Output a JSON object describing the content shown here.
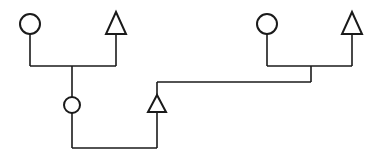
{
  "diagram": {
    "type": "pedigree",
    "stroke_color": "#1a1a1a",
    "background": "#ffffff",
    "nodes": [
      {
        "id": "gen1-left-female",
        "shape": "circle",
        "sex": "female",
        "cx": 30,
        "cy": 24,
        "r": 10
      },
      {
        "id": "gen1-left-male",
        "shape": "triangle",
        "sex": "male",
        "apex": [
          116,
          12
        ],
        "base_y": 34,
        "half_width": 10
      },
      {
        "id": "gen1-right-female",
        "shape": "circle",
        "sex": "female",
        "cx": 267,
        "cy": 24,
        "r": 10
      },
      {
        "id": "gen1-right-male",
        "shape": "triangle",
        "sex": "male",
        "apex": [
          352,
          12
        ],
        "base_y": 34,
        "half_width": 10
      },
      {
        "id": "gen2-female",
        "shape": "circle",
        "sex": "female",
        "cx": 72,
        "cy": 105,
        "r": 8
      },
      {
        "id": "gen2-male",
        "shape": "triangle",
        "sex": "male",
        "apex": [
          157,
          95
        ],
        "base_y": 112,
        "half_width": 9
      }
    ],
    "edges": [
      {
        "from": "gen1-left-female",
        "to": "gen1-left-male",
        "kind": "mating"
      },
      {
        "from": "gen1-left-pair",
        "to": "gen2-female",
        "kind": "descent"
      },
      {
        "from": "gen1-right-female",
        "to": "gen1-right-male",
        "kind": "mating"
      },
      {
        "from": "gen1-right-pair",
        "to": "gen2-male",
        "kind": "descent"
      },
      {
        "from": "gen2-female",
        "to": "gen2-male",
        "kind": "mating"
      }
    ]
  }
}
